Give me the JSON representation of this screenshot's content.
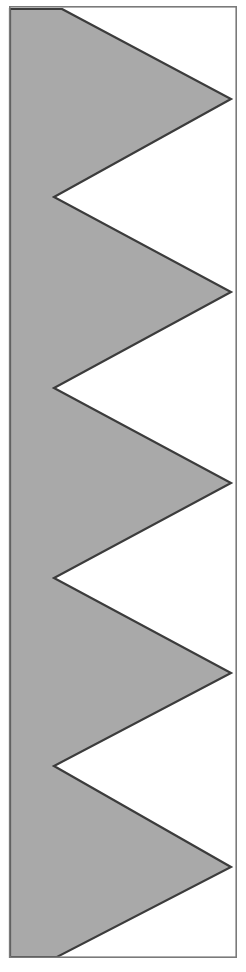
{
  "figure": {
    "canvas": {
      "width": 246,
      "height": 972,
      "background_color": "#ffffff"
    },
    "frame": {
      "name": "figure-border",
      "x": 9,
      "y": 6,
      "width": 228,
      "height": 952,
      "stroke_color": "#7a7a7a",
      "stroke_width": 1.6,
      "fill": "none"
    },
    "shape": {
      "name": "sawtooth-polygon",
      "fill_color": "#a9a9a9",
      "stroke_color": "#3c3c3c",
      "stroke_width": 2.2,
      "teeth_count": 5,
      "left_edge_x": 10,
      "tip_x": 231,
      "notch_x": 54,
      "top_vertex": [
        62,
        9
      ],
      "bottom_vertex": [
        57,
        957
      ],
      "right_tip_points_y": [
        99,
        292,
        483,
        673,
        867
      ],
      "left_notch_points_y": [
        197,
        388,
        578,
        766
      ],
      "points": "62,9 231,99 54,197 231,292 54,388 231,483 54,578 231,673 54,766 231,867 57,957 10,957 10,9"
    }
  }
}
